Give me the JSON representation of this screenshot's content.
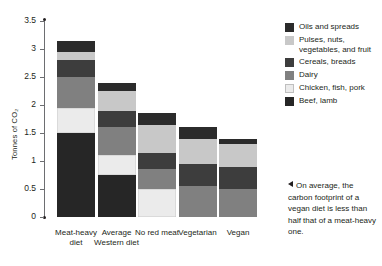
{
  "chart_data": {
    "type": "bar",
    "title": "",
    "subtitle": "",
    "xlabel": "",
    "ylabel": "Tonnes of CO₂",
    "ylim": [
      0,
      3.5
    ],
    "ytick_values": [
      0,
      0.5,
      1,
      1.5,
      2,
      2.5,
      3,
      3.5
    ],
    "ytick_labels": [
      "0",
      "0.5",
      "1",
      "1.5",
      "2",
      "2.5",
      "3",
      "3.5"
    ],
    "grid": false,
    "stacked": true,
    "legend_position": "right-top",
    "categories": [
      "Meat-heavy diet",
      "Average Western diet",
      "No red meat",
      "Vegetarian",
      "Vegan"
    ],
    "series": [
      {
        "name": "Beef, lamb",
        "color": "#262626",
        "values": [
          1.5,
          0.75,
          0,
          0,
          0
        ]
      },
      {
        "name": "Chicken, fish, pork",
        "color": "#ebebeb",
        "values": [
          0.45,
          0.35,
          0.5,
          0,
          0
        ]
      },
      {
        "name": "Dairy",
        "color": "#808080",
        "values": [
          0.55,
          0.5,
          0.35,
          0.55,
          0.5
        ]
      },
      {
        "name": "Cereals, breads",
        "color": "#3d3d3d",
        "values": [
          0.3,
          0.3,
          0.3,
          0.4,
          0.4
        ]
      },
      {
        "name": "Pulses, nuts, vegetables, and fruit",
        "color": "#c8c8c8",
        "values": [
          0.15,
          0.35,
          0.5,
          0.45,
          0.4
        ]
      },
      {
        "name": "Oils and spreads",
        "color": "#2b2b2b",
        "values": [
          0.2,
          0.15,
          0.2,
          0.2,
          0.1
        ]
      }
    ],
    "totals": [
      3.15,
      2.4,
      1.85,
      1.6,
      1.4
    ]
  },
  "legend": {
    "items": [
      {
        "label": "Oils and spreads",
        "color": "#2b2b2b"
      },
      {
        "label": "Pulses, nuts, vegetables, and fruit",
        "color": "#c8c8c8"
      },
      {
        "label": "Cereals, breads",
        "color": "#3d3d3d"
      },
      {
        "label": "Dairy",
        "color": "#808080"
      },
      {
        "label": "Chicken, fish, pork",
        "color": "#ebebeb"
      },
      {
        "label": "Beef, lamb",
        "color": "#262626"
      }
    ]
  },
  "annotation": {
    "text": "On average, the carbon footprint of a vegan diet is less than half that of a meat-heavy one."
  }
}
